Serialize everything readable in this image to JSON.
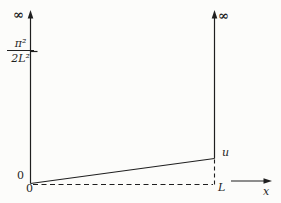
{
  "figure": {
    "background_color": "#fcfcfa",
    "ink_color": "#1f1f1f",
    "labels": {
      "infinity_left": "∞",
      "infinity_right": "∞",
      "energy_level": {
        "numerator": "π²",
        "denominator": "2L²"
      },
      "origin_y_value": "0",
      "origin_x_value": "0",
      "curve_label": "u",
      "well_width_label": "L",
      "x_axis_label": "x"
    }
  }
}
